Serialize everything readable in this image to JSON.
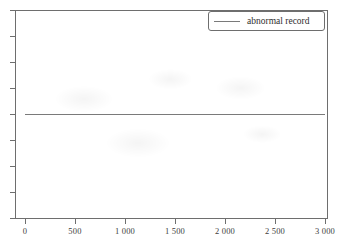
{
  "chart_data": {
    "type": "line",
    "title": "",
    "xlabel": "",
    "ylabel": "",
    "xlim": [
      0,
      3000
    ],
    "ylim": [
      0,
      1
    ],
    "grid": false,
    "legend_position": "top-right",
    "x_tick_labels": [
      "0",
      "500",
      "1 000",
      "1 500",
      "2 000",
      "2 500",
      "3 000"
    ],
    "x_tick_values": [
      0,
      500,
      1000,
      1500,
      2000,
      2500,
      3000
    ],
    "y_tick_labels": [
      "",
      "",
      "",
      "",
      "",
      "",
      "",
      "",
      ""
    ],
    "y_tick_count": 9,
    "series": [
      {
        "name": "abnormal record",
        "color": "#7a7a7a",
        "style": "solid",
        "x": [
          0,
          500,
          1000,
          1500,
          2000,
          2500,
          3000
        ],
        "values": [
          0.5,
          0.5,
          0.5,
          0.5,
          0.5,
          0.5,
          0.5
        ]
      }
    ],
    "annotations": []
  },
  "legend": {
    "entries": [
      {
        "label": "abnormal record"
      }
    ]
  },
  "axes": {
    "x_labels": [
      "0",
      "500",
      "1 000",
      "1 500",
      "2 000",
      "2 500",
      "3 000"
    ]
  }
}
